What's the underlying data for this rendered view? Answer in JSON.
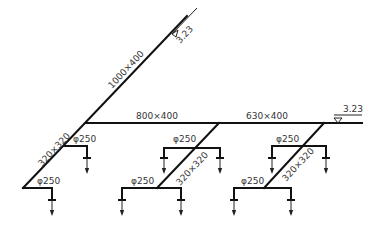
{
  "diagram": {
    "type": "duct-system-axonometric",
    "stroke_color": "#111111",
    "label_color": "#333333",
    "main_riser": {
      "size": "1000×400"
    },
    "main_branch": {
      "size_left": "800×400",
      "size_right": "630×400"
    },
    "elevations": [
      {
        "id": "top",
        "value": "3.23"
      },
      {
        "id": "right",
        "value": "3.23"
      }
    ],
    "sub_riser_left": {
      "size": "320×320"
    },
    "sub_riser_mid": {
      "size": "320×320"
    },
    "sub_riser_right": {
      "size": "320×320"
    },
    "outlets": [
      {
        "id": "left-upper",
        "size": "φ250"
      },
      {
        "id": "left-lower",
        "size": "φ250"
      },
      {
        "id": "mid-upper",
        "size": "φ250"
      },
      {
        "id": "mid-lower",
        "size": "φ250"
      },
      {
        "id": "right-upper",
        "size": "φ250"
      },
      {
        "id": "right-lower",
        "size": "φ250"
      }
    ]
  }
}
